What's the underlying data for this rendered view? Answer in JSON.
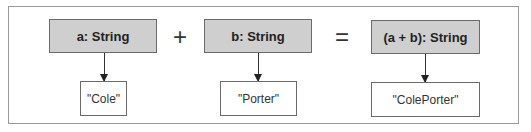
{
  "diagram": {
    "operator_plus": "+",
    "operator_equals": "=",
    "operands": [
      {
        "type_label": "a: String",
        "value": "\"Cole\""
      },
      {
        "type_label": "b: String",
        "value": "\"Porter\""
      }
    ],
    "result": {
      "type_label": "(a + b): String",
      "value": "\"ColePorter\""
    },
    "colors": {
      "type_box_fill": "#cfcfcf",
      "border": "#6b6b6b",
      "value_box_fill": "#ffffff"
    }
  }
}
